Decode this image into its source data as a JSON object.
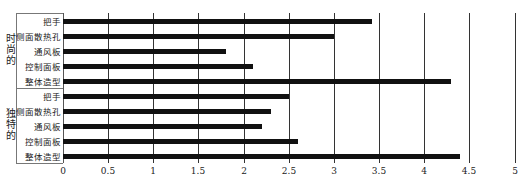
{
  "chart_data": {
    "type": "bar",
    "orientation": "horizontal",
    "title": "",
    "xlabel": "",
    "ylabel": "",
    "xlim": [
      0,
      5
    ],
    "x_ticks": [
      "0",
      "0.5",
      "1",
      "1.5",
      "2",
      "2.5",
      "3",
      "3.5",
      "4",
      "4.5",
      "5"
    ],
    "grid": true,
    "groups": [
      {
        "name": "时尚的",
        "categories": [
          "把手",
          "侧面散热孔",
          "通风板",
          "控制面板",
          "整体造型"
        ],
        "values": [
          3.42,
          3.0,
          1.8,
          2.1,
          4.3
        ]
      },
      {
        "name": "独特的",
        "categories": [
          "把手",
          "侧面散热孔",
          "通风板",
          "控制面板",
          "整体造型"
        ],
        "values": [
          2.5,
          2.3,
          2.2,
          2.6,
          4.4
        ]
      }
    ],
    "bar_color": "#111111"
  }
}
